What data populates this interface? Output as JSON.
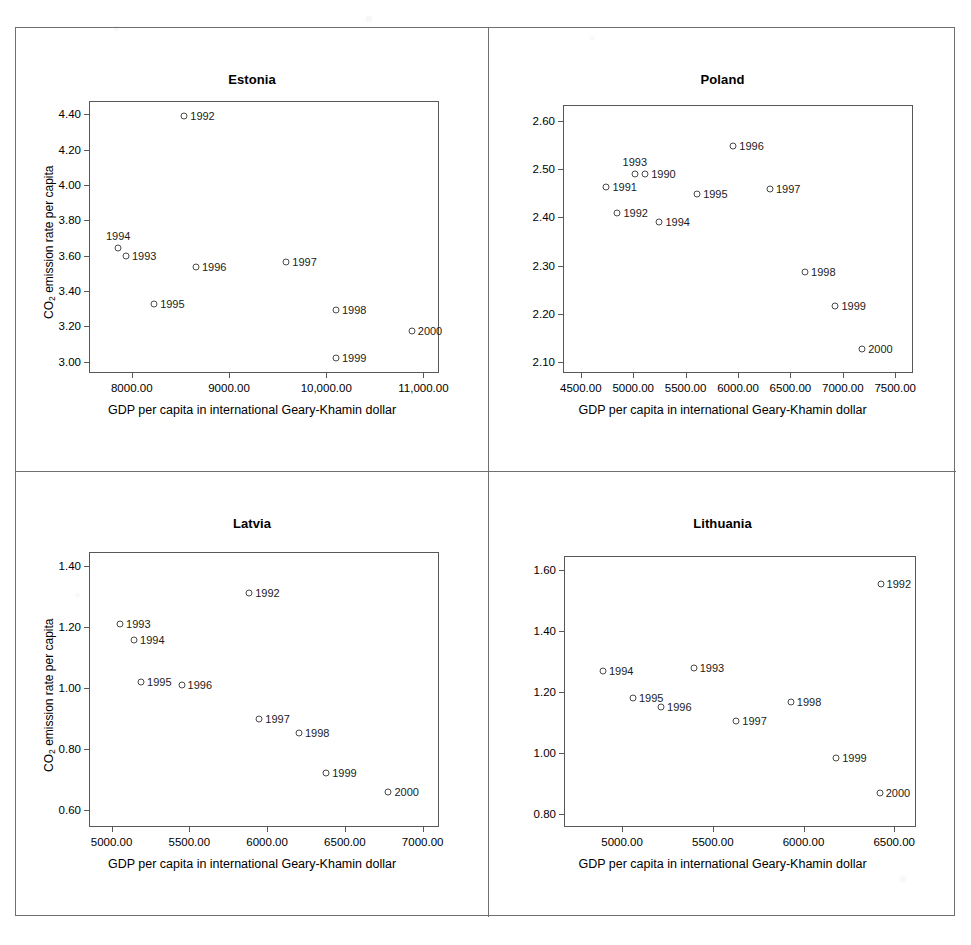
{
  "figure": {
    "shared_xlabel": "GDP per capita in international Geary-Khamin dollar",
    "shared_ylabel_prefix": "CO",
    "shared_ylabel_sub": "2",
    "shared_ylabel_suffix": " emission rate per capita"
  },
  "chart_data": [
    {
      "type": "scatter",
      "title": "Estonia",
      "xlabel": "GDP per capita in international Geary-Khamin dollar",
      "ylabel": "CO2 emission rate per capita",
      "xlim": [
        7560,
        11160
      ],
      "ylim": [
        2.935,
        4.475
      ],
      "xticks": [
        8000,
        9000,
        10000,
        11000
      ],
      "xticklabels": [
        "8000.00",
        "9000.00",
        "10,000.00",
        "11,000.00"
      ],
      "yticks": [
        3.0,
        3.2,
        3.4,
        3.6,
        3.8,
        4.0,
        4.2,
        4.4
      ],
      "yticklabels": [
        "3.00",
        "3.20",
        "3.40",
        "3.60",
        "3.80",
        "4.00",
        "4.20",
        "4.40"
      ],
      "grid": false,
      "legend": "none",
      "points": [
        {
          "label": "1992",
          "x": 8540,
          "y": 4.39,
          "label_pos": "right"
        },
        {
          "label": "1993",
          "x": 7940,
          "y": 3.6,
          "label_pos": "right"
        },
        {
          "label": "1994",
          "x": 7860,
          "y": 3.645,
          "label_pos": "above"
        },
        {
          "label": "1995",
          "x": 8230,
          "y": 3.325,
          "label_pos": "right"
        },
        {
          "label": "1996",
          "x": 8660,
          "y": 3.535,
          "label_pos": "right"
        },
        {
          "label": "1997",
          "x": 9590,
          "y": 3.565,
          "label_pos": "right"
        },
        {
          "label": "1998",
          "x": 10100,
          "y": 3.29,
          "label_pos": "right"
        },
        {
          "label": "1999",
          "x": 10100,
          "y": 3.02,
          "label_pos": "right"
        },
        {
          "label": "2000",
          "x": 10880,
          "y": 3.175,
          "label_pos": "right"
        }
      ]
    },
    {
      "type": "scatter",
      "title": "Poland",
      "xlabel": "GDP per capita in international Geary-Khamin dollar",
      "ylabel": "CO2 emission rate per capita",
      "xlim": [
        4330,
        7670
      ],
      "ylim": [
        2.077,
        2.633
      ],
      "xticks": [
        4500,
        5000,
        5500,
        6000,
        6500,
        7000,
        7500
      ],
      "xticklabels": [
        "4500.00",
        "5000.00",
        "5500.00",
        "6000.00",
        "6500.00",
        "7000.00",
        "7500.00"
      ],
      "yticks": [
        2.1,
        2.2,
        2.3,
        2.4,
        2.5,
        2.6
      ],
      "yticklabels": [
        "2.10",
        "2.20",
        "2.30",
        "2.40",
        "2.50",
        "2.60"
      ],
      "grid": false,
      "legend": "none",
      "points": [
        {
          "label": "1990",
          "x": 5115,
          "y": 2.489,
          "label_pos": "right"
        },
        {
          "label": "1991",
          "x": 4745,
          "y": 2.462,
          "label_pos": "right"
        },
        {
          "label": "1992",
          "x": 4850,
          "y": 2.409,
          "label_pos": "right"
        },
        {
          "label": "1993",
          "x": 5015,
          "y": 2.49,
          "label_pos": "above"
        },
        {
          "label": "1994",
          "x": 5250,
          "y": 2.39,
          "label_pos": "right"
        },
        {
          "label": "1995",
          "x": 5610,
          "y": 2.448,
          "label_pos": "right"
        },
        {
          "label": "1996",
          "x": 5955,
          "y": 2.547,
          "label_pos": "right"
        },
        {
          "label": "1997",
          "x": 6305,
          "y": 2.458,
          "label_pos": "right"
        },
        {
          "label": "1998",
          "x": 6640,
          "y": 2.287,
          "label_pos": "right"
        },
        {
          "label": "1999",
          "x": 6930,
          "y": 2.216,
          "label_pos": "right"
        },
        {
          "label": "2000",
          "x": 7185,
          "y": 2.126,
          "label_pos": "right"
        }
      ]
    },
    {
      "type": "scatter",
      "title": "Latvia",
      "xlabel": "GDP per capita in international Geary-Khamin dollar",
      "ylabel": "CO2 emission rate per capita",
      "xlim": [
        4855,
        7105
      ],
      "ylim": [
        0.545,
        1.445
      ],
      "xticks": [
        5000,
        5500,
        6000,
        6500,
        7000
      ],
      "xticklabels": [
        "5000.00",
        "5500.00",
        "6000.00",
        "6500.00",
        "7000.00"
      ],
      "yticks": [
        0.6,
        0.8,
        1.0,
        1.2,
        1.4
      ],
      "yticklabels": [
        "0.60",
        "0.80",
        "1.00",
        "1.20",
        "1.40"
      ],
      "grid": false,
      "legend": "none",
      "points": [
        {
          "label": "1992",
          "x": 5885,
          "y": 1.312,
          "label_pos": "right"
        },
        {
          "label": "1993",
          "x": 5055,
          "y": 1.208,
          "label_pos": "right"
        },
        {
          "label": "1994",
          "x": 5145,
          "y": 1.158,
          "label_pos": "right"
        },
        {
          "label": "1995",
          "x": 5190,
          "y": 1.018,
          "label_pos": "right"
        },
        {
          "label": "1996",
          "x": 5450,
          "y": 1.01,
          "label_pos": "right"
        },
        {
          "label": "1997",
          "x": 5950,
          "y": 0.897,
          "label_pos": "right"
        },
        {
          "label": "1998",
          "x": 6205,
          "y": 0.854,
          "label_pos": "right"
        },
        {
          "label": "1999",
          "x": 6380,
          "y": 0.721,
          "label_pos": "right"
        },
        {
          "label": "2000",
          "x": 6780,
          "y": 0.658,
          "label_pos": "right"
        }
      ]
    },
    {
      "type": "scatter",
      "title": "Lithuania",
      "xlabel": "GDP per capita in international Geary-Khamin dollar",
      "ylabel": "CO2 emission rate per capita",
      "xlim": [
        4680,
        6620
      ],
      "ylim": [
        0.757,
        1.645
      ],
      "xticks": [
        5000,
        5500,
        6000,
        6500
      ],
      "xticklabels": [
        "5000.00",
        "5500.00",
        "6000.00",
        "6500.00"
      ],
      "yticks": [
        0.8,
        1.0,
        1.2,
        1.4,
        1.6
      ],
      "yticklabels": [
        "0.80",
        "1.00",
        "1.20",
        "1.40",
        "1.60"
      ],
      "grid": false,
      "legend": "none",
      "points": [
        {
          "label": "1992",
          "x": 6425,
          "y": 1.553,
          "label_pos": "right"
        },
        {
          "label": "1993",
          "x": 5395,
          "y": 1.277,
          "label_pos": "right"
        },
        {
          "label": "1994",
          "x": 4895,
          "y": 1.268,
          "label_pos": "right"
        },
        {
          "label": "1995",
          "x": 5060,
          "y": 1.18,
          "label_pos": "right"
        },
        {
          "label": "1996",
          "x": 5215,
          "y": 1.149,
          "label_pos": "right"
        },
        {
          "label": "1997",
          "x": 5630,
          "y": 1.105,
          "label_pos": "right"
        },
        {
          "label": "1998",
          "x": 5930,
          "y": 1.166,
          "label_pos": "right"
        },
        {
          "label": "1999",
          "x": 6180,
          "y": 0.982,
          "label_pos": "right"
        },
        {
          "label": "2000",
          "x": 6420,
          "y": 0.868,
          "label_pos": "right"
        }
      ]
    }
  ]
}
